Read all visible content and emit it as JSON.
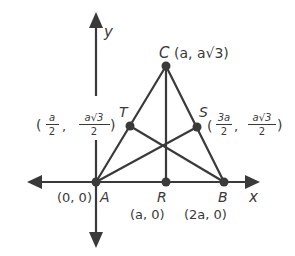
{
  "diagram": {
    "type": "coordinate-geometry-triangle",
    "axes": {
      "x_label": "x",
      "y_label": "y"
    },
    "points": {
      "A": {
        "name": "A",
        "coords": "(0, 0)"
      },
      "B": {
        "name": "B",
        "coords": "(2a, 0)"
      },
      "C": {
        "name": "C",
        "coords": "(a, a√3)"
      },
      "R": {
        "name": "R",
        "coords": "(a, 0)"
      },
      "S": {
        "name": "S",
        "x_num": "3a",
        "x_den": "2",
        "y_num": "a√3",
        "y_den": "2"
      },
      "T": {
        "name": "T",
        "x_num": "a",
        "x_den": "2",
        "y_num": "a√3",
        "y_den": "2"
      }
    },
    "segments": [
      "AB",
      "AC",
      "BC",
      "CR",
      "AS",
      "BT"
    ],
    "colors": {
      "line": "#3a3a3a",
      "text": "#3a3a3a",
      "background": "#ffffff"
    }
  }
}
